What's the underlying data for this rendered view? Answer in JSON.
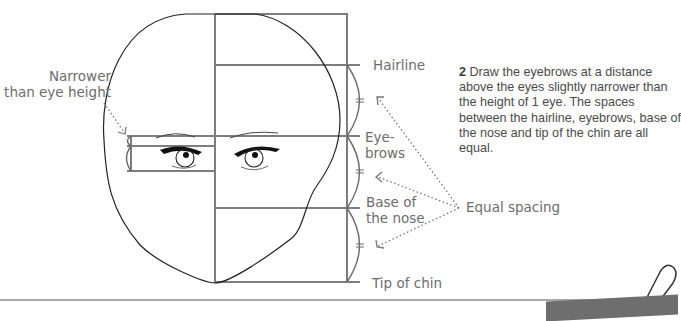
{
  "diagram": {
    "type": "face-proportion-guide",
    "labels": {
      "narrower": [
        "Narrower",
        "than eye height"
      ],
      "hairline": "Hairline",
      "eyebrows": [
        "Eye-",
        "brows"
      ],
      "nose": [
        "Base of",
        "the nose"
      ],
      "chin": "Tip of chin",
      "equal_spacing": "Equal spacing"
    },
    "instruction": {
      "step_number": "2",
      "text": "Draw the eyebrows at a distance above the eyes slightly narrower than the height of 1 eye. The spaces between the hairline, eyebrows, base of the nose and tip of the chin are all equal."
    },
    "note_tab": {
      "label": "NOTE"
    },
    "guide_lines": {
      "top_y": 14,
      "hairline_y": 65,
      "eyebrows_y": 136,
      "eye_top_y": 146,
      "eye_bottom_y": 171,
      "nose_y": 208,
      "chin_y": 282,
      "center_x": 215,
      "right_x": 347
    },
    "colors": {
      "guide_line": "#7a7a7a",
      "outline": "#2a2a2a",
      "text": "#6d6d6d",
      "note_tab": "#6e6e6e"
    }
  }
}
